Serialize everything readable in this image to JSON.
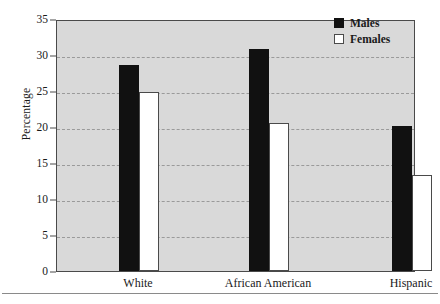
{
  "chart_data": {
    "type": "bar",
    "title": "",
    "xlabel": "",
    "ylabel": "Percentage",
    "ylim": [
      0,
      35
    ],
    "yticks": [
      0,
      5,
      10,
      15,
      20,
      25,
      30,
      35
    ],
    "grid": true,
    "legend_position": "top-right",
    "categories": [
      "White",
      "African American",
      "Hispanic"
    ],
    "series": [
      {
        "name": "Males",
        "color": "#111111",
        "values": [
          28.6,
          30.9,
          20.1
        ]
      },
      {
        "name": "Females",
        "color": "#ffffff",
        "values": [
          24.8,
          20.5,
          13.3
        ]
      }
    ]
  },
  "legend": {
    "items": [
      {
        "label": "Males",
        "swatch": "filled-square-icon"
      },
      {
        "label": "Females",
        "swatch": "empty-square-icon"
      }
    ]
  },
  "style": {
    "plot_background": "#d9d9d9",
    "frame_color": "#4a4a4a",
    "gridline_color": "#9a9a9a",
    "page_background": "#ffffff"
  }
}
